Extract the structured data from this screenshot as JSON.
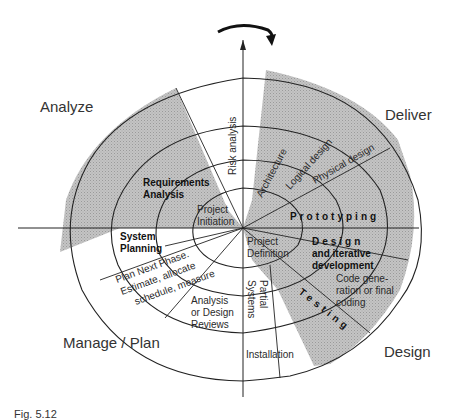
{
  "quadrants": {
    "top_left": "Analyze",
    "top_right": "Deliver",
    "bottom_left": "Manage / Plan",
    "bottom_right": "Design"
  },
  "phases": {
    "requirements_line1": "Requirements",
    "requirements_line2": "Analysis",
    "system_planning_line1": "System",
    "system_planning_line2": "Planning",
    "prototyping": "Prototyping",
    "design_line1": "Design",
    "design_line2": "and iterative",
    "design_line3": "development",
    "testing": "Testing"
  },
  "activities": {
    "risk_analysis": "Risk analysis",
    "architecture": "Architecture",
    "logical_design": "Logical design",
    "physical_design": "Physical design",
    "project_initiation_line1": "Project",
    "project_initiation_line2": "Initiation",
    "project_definition_line1": "Project",
    "project_definition_line2": "Definition",
    "plan_next_line1": "Plan Next Phase.",
    "plan_next_line2": "Estimate, allocate",
    "plan_next_line3": "schedule, measure",
    "reviews_line1": "Analysis",
    "reviews_line2": "or Design",
    "reviews_line3": "Reviews",
    "partial_line1": "Partial",
    "partial_line2": "Systems",
    "installation": "Installation",
    "code_line1": "Code gene-",
    "code_line2": "ration or final",
    "code_line3": "coding"
  },
  "caption": "Fig. 5.12",
  "colors": {
    "shade": "#b8b8b8",
    "line": "#222222"
  }
}
